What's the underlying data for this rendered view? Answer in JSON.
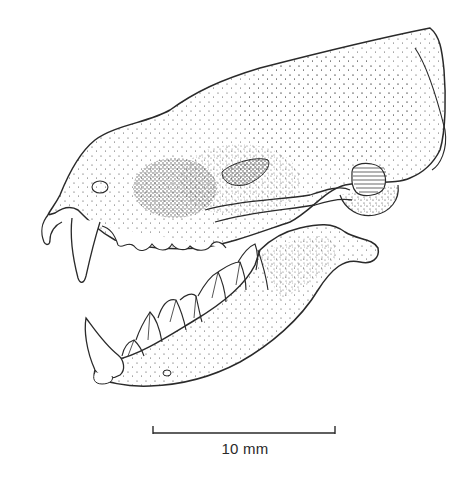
{
  "figure": {
    "style": "stippled ink drawing",
    "colors": {
      "ink": "#2a2a2a",
      "stipple": "#3a3a3a",
      "background": "#ffffff"
    }
  },
  "scale_bar": {
    "label": "10 mm",
    "x_start": 153,
    "x_end": 335,
    "y": 433
  }
}
